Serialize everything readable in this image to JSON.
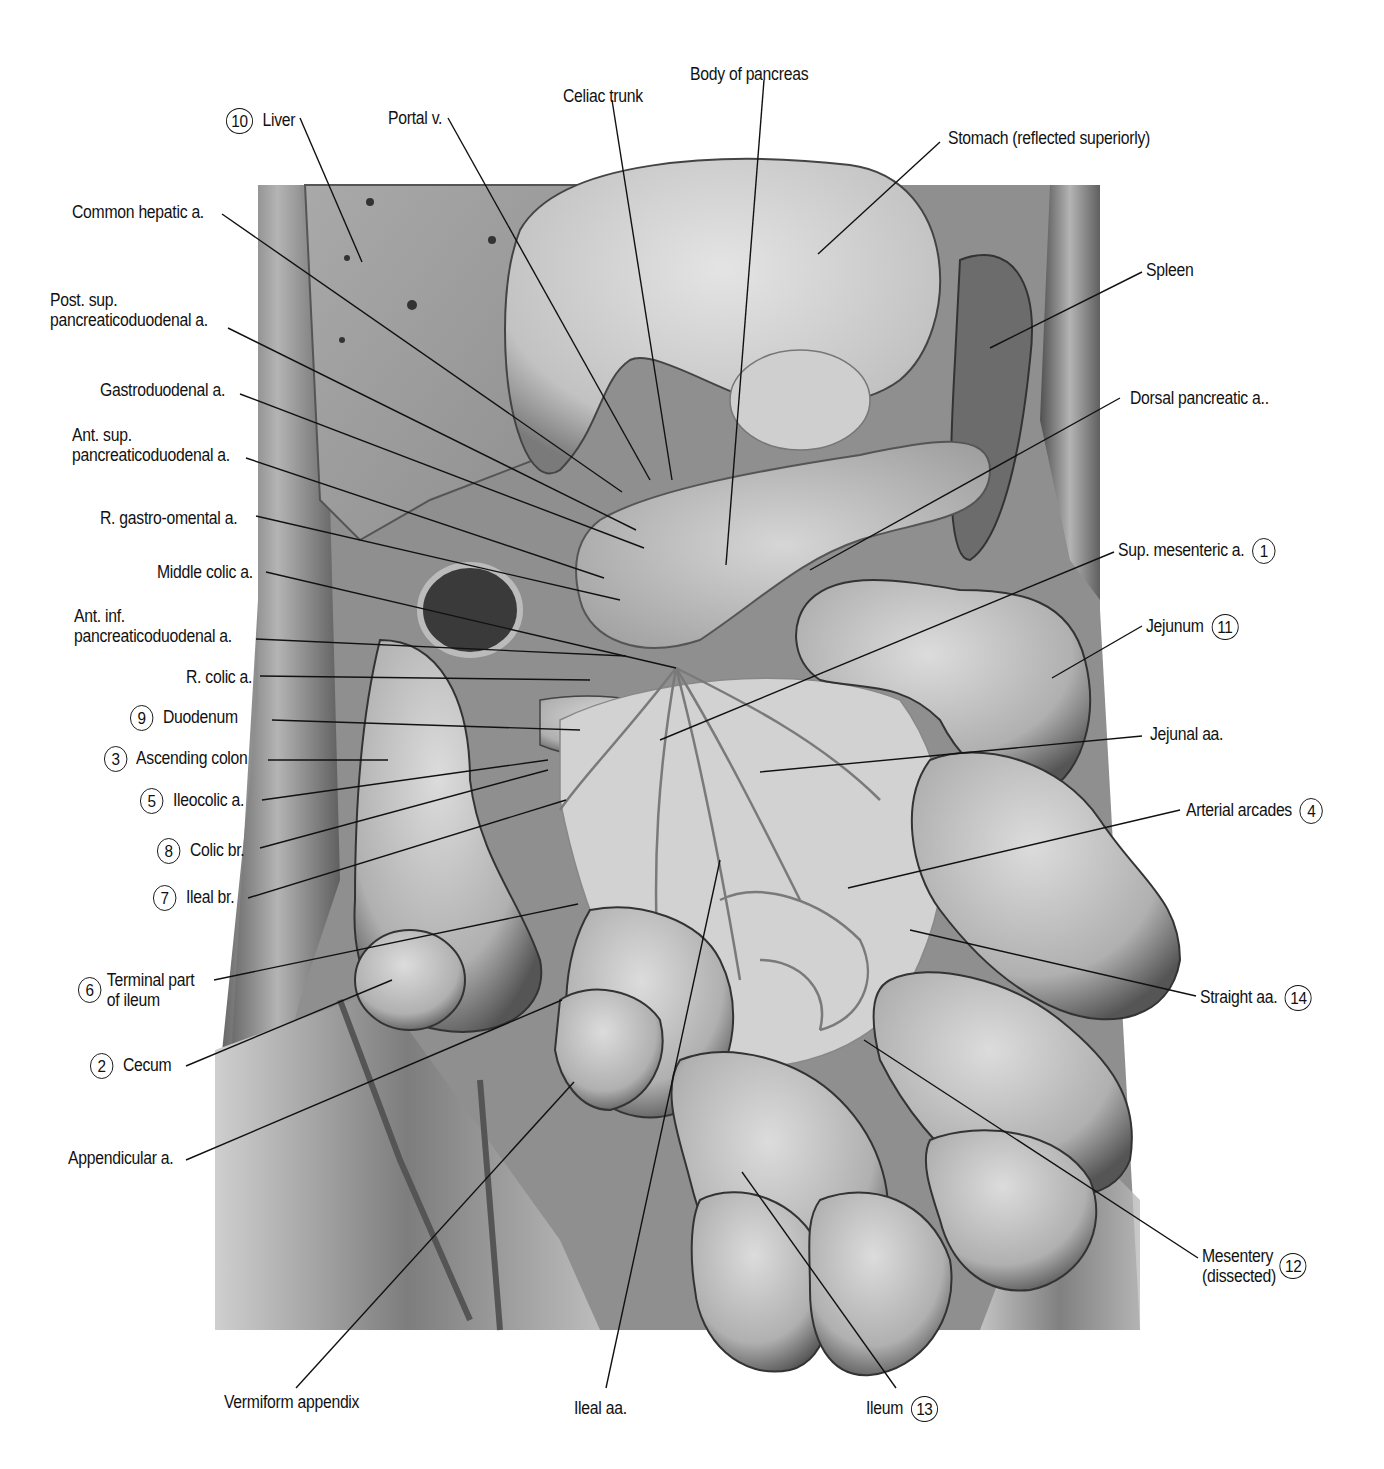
{
  "figure": {
    "palette": {
      "background": "#ffffff",
      "tissue_light": "#d9d9d9",
      "tissue_mid": "#a8a8a8",
      "tissue_dark": "#3a3a3a",
      "line": "#111111"
    }
  },
  "labels": [
    {
      "id": "liver",
      "num": "10",
      "text": "Liver",
      "x": 226,
      "y": 108,
      "side": "left-num",
      "line": [
        [
          300,
          118
        ],
        [
          362,
          262
        ]
      ]
    },
    {
      "id": "portal-v",
      "text": "Portal v.",
      "x": 388,
      "y": 108,
      "line": [
        [
          448,
          118
        ],
        [
          650,
          480
        ]
      ]
    },
    {
      "id": "celiac-trunk",
      "text": "Celiac trunk",
      "x": 563,
      "y": 86,
      "line": [
        [
          612,
          100
        ],
        [
          672,
          480
        ]
      ]
    },
    {
      "id": "body-of-pancreas",
      "text": "Body of pancreas",
      "x": 690,
      "y": 64,
      "line": [
        [
          764,
          80
        ],
        [
          726,
          565
        ]
      ]
    },
    {
      "id": "stomach",
      "text": "Stomach (reflected superiorly)",
      "x": 948,
      "y": 128,
      "line": [
        [
          940,
          142
        ],
        [
          818,
          254
        ]
      ]
    },
    {
      "id": "spleen",
      "text": "Spleen",
      "x": 1146,
      "y": 260,
      "line": [
        [
          1142,
          272
        ],
        [
          990,
          348
        ]
      ]
    },
    {
      "id": "dorsal-pancreatic",
      "text": "Dorsal pancreatic a..",
      "x": 1130,
      "y": 388,
      "line": [
        [
          1120,
          398
        ],
        [
          810,
          570
        ]
      ]
    },
    {
      "id": "common-hepatic",
      "text": "Common hepatic a.",
      "x": 72,
      "y": 202,
      "line": [
        [
          222,
          214
        ],
        [
          622,
          492
        ]
      ]
    },
    {
      "id": "post-sup-pd",
      "text": "Post. sup.\npancreaticoduodenal a.",
      "x": 50,
      "y": 290,
      "line": [
        [
          228,
          328
        ],
        [
          636,
          530
        ]
      ]
    },
    {
      "id": "gastroduodenal",
      "text": "Gastroduodenal a.",
      "x": 100,
      "y": 380,
      "line": [
        [
          240,
          394
        ],
        [
          644,
          548
        ]
      ]
    },
    {
      "id": "ant-sup-pd",
      "text": "Ant. sup.\npancreaticoduodenal a.",
      "x": 72,
      "y": 425,
      "line": [
        [
          246,
          458
        ],
        [
          604,
          578
        ]
      ]
    },
    {
      "id": "r-gastro-omental",
      "text": "R. gastro-omental a.",
      "x": 100,
      "y": 508,
      "line": [
        [
          256,
          516
        ],
        [
          620,
          600
        ]
      ]
    },
    {
      "id": "middle-colic",
      "text": "Middle colic a.",
      "x": 157,
      "y": 562,
      "line": [
        [
          266,
          572
        ],
        [
          676,
          668
        ]
      ]
    },
    {
      "id": "ant-inf-pd",
      "text": "Ant. inf.\npancreaticoduodenal a.",
      "x": 74,
      "y": 606,
      "line": [
        [
          256,
          639
        ],
        [
          626,
          656
        ]
      ]
    },
    {
      "id": "r-colic",
      "text": "R. colic a.",
      "x": 186,
      "y": 667,
      "line": [
        [
          260,
          676
        ],
        [
          590,
          680
        ]
      ]
    },
    {
      "id": "duodenum",
      "num": "9",
      "text": "Duodenum",
      "x": 130,
      "y": 705,
      "side": "left-num",
      "line": [
        [
          272,
          720
        ],
        [
          580,
          730
        ]
      ]
    },
    {
      "id": "ascending-colon",
      "num": "3",
      "text": "Ascending colon",
      "x": 104,
      "y": 746,
      "side": "left-num",
      "line": [
        [
          268,
          760
        ],
        [
          388,
          760
        ]
      ]
    },
    {
      "id": "ileocolic",
      "num": "5",
      "text": "Ileocolic a.",
      "x": 140,
      "y": 788,
      "side": "left-num",
      "line": [
        [
          262,
          800
        ],
        [
          548,
          760
        ]
      ]
    },
    {
      "id": "colic-br",
      "num": "8",
      "text": "Colic br.",
      "x": 157,
      "y": 838,
      "side": "left-num",
      "line": [
        [
          260,
          848
        ],
        [
          548,
          770
        ]
      ]
    },
    {
      "id": "ileal-br",
      "num": "7",
      "text": "Ileal br.",
      "x": 153,
      "y": 885,
      "side": "left-num",
      "line": [
        [
          248,
          898
        ],
        [
          566,
          800
        ]
      ]
    },
    {
      "id": "terminal-ileum",
      "num": "6",
      "text": "Terminal part\nof ileum",
      "x": 78,
      "y": 970,
      "side": "left-num",
      "line": [
        [
          214,
          980
        ],
        [
          578,
          904
        ]
      ]
    },
    {
      "id": "cecum",
      "num": "2",
      "text": "Cecum",
      "x": 90,
      "y": 1053,
      "side": "left-num",
      "line": [
        [
          186,
          1066
        ],
        [
          392,
          980
        ]
      ]
    },
    {
      "id": "appendicular",
      "text": "Appendicular a.",
      "x": 68,
      "y": 1148,
      "line": [
        [
          186,
          1160
        ],
        [
          562,
          1000
        ]
      ]
    },
    {
      "id": "vermiform-appendix",
      "text": "Vermiform appendix",
      "x": 224,
      "y": 1392,
      "line": [
        [
          296,
          1388
        ],
        [
          574,
          1082
        ]
      ]
    },
    {
      "id": "ileal-aa",
      "text": "Ileal aa.",
      "x": 574,
      "y": 1398,
      "line": [
        [
          606,
          1388
        ],
        [
          720,
          860
        ]
      ]
    },
    {
      "id": "ileum",
      "num": "13",
      "text": "Ileum",
      "x": 866,
      "y": 1396,
      "side": "right-num",
      "line": [
        [
          896,
          1388
        ],
        [
          742,
          1172
        ]
      ]
    },
    {
      "id": "sup-mesenteric",
      "num": "1",
      "text": "Sup. mesenteric a.",
      "x": 1118,
      "y": 538,
      "side": "right-num",
      "line": [
        [
          1114,
          552
        ],
        [
          660,
          740
        ]
      ]
    },
    {
      "id": "jejunum",
      "num": "11",
      "text": "Jejunum",
      "x": 1146,
      "y": 614,
      "side": "right-num",
      "line": [
        [
          1142,
          626
        ],
        [
          1052,
          678
        ]
      ]
    },
    {
      "id": "jejunal-aa",
      "text": "Jejunal aa.",
      "x": 1150,
      "y": 724,
      "line": [
        [
          1142,
          736
        ],
        [
          760,
          772
        ]
      ]
    },
    {
      "id": "arterial-arcades",
      "num": "4",
      "text": "Arterial arcades",
      "x": 1186,
      "y": 798,
      "side": "right-num",
      "line": [
        [
          1180,
          810
        ],
        [
          848,
          888
        ]
      ]
    },
    {
      "id": "straight-aa",
      "num": "14",
      "text": "Straight aa.",
      "x": 1200,
      "y": 985,
      "side": "right-num",
      "line": [
        [
          1196,
          996
        ],
        [
          910,
          930
        ]
      ]
    },
    {
      "id": "mesentery",
      "num": "12",
      "text": "Mesentery\n(dissected)",
      "x": 1202,
      "y": 1246,
      "side": "right-num",
      "line": [
        [
          1198,
          1258
        ],
        [
          864,
          1040
        ]
      ]
    }
  ]
}
